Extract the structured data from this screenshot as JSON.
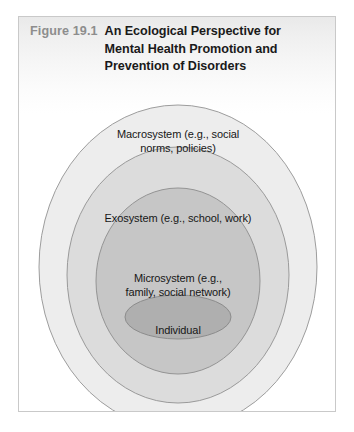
{
  "figure": {
    "number": "Figure 19.1",
    "title_lines": [
      "An Ecological Perspective for",
      "Mental Health Promotion and",
      "Prevention of Disorders"
    ],
    "title_full": "An Ecological Perspective for Mental Health Promotion and Prevention of Disorders"
  },
  "colors": {
    "frame_border": "#c9c9c9",
    "figure_number": "#8d8d8d",
    "title_text": "#1a1a1a",
    "label_text": "#171717",
    "ring_stroke": "#9a9a9a",
    "ring_1_fill": "#ededed",
    "ring_2_fill": "#dcdcdc",
    "ring_3_fill": "#c6c6c6",
    "ring_4_fill": "#afafaf"
  },
  "diagram": {
    "type": "nested-ellipses",
    "rings": [
      {
        "id": "macrosystem",
        "level": 1,
        "fill": "#ededed",
        "label_lines": [
          "Macrosystem (e.g., social",
          "norms, policies)"
        ],
        "label_full": "Macrosystem (e.g., social norms, policies)"
      },
      {
        "id": "exosystem",
        "level": 2,
        "fill": "#dcdcdc",
        "label_lines": [
          "Exosystem (e.g., school, work)"
        ],
        "label_full": "Exosystem (e.g., school, work)"
      },
      {
        "id": "microsystem",
        "level": 3,
        "fill": "#c6c6c6",
        "label_lines": [
          "Microsystem (e.g.,",
          "family, social network)"
        ],
        "label_full": "Microsystem (e.g., family, social network)"
      },
      {
        "id": "individual",
        "level": 4,
        "fill": "#afafaf",
        "label_lines": [
          "Individual"
        ],
        "label_full": "Individual"
      }
    ]
  }
}
